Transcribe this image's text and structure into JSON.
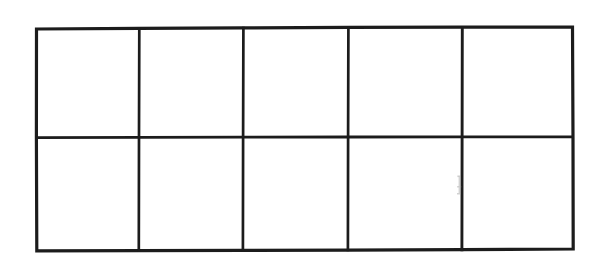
{
  "document": {
    "title": "Blank Grid Table",
    "description": "Hand-drawn blank grid of 5 columns by 2 rows on white paper",
    "background_color": "#ffffff",
    "line_color": "#1c1c1c",
    "artifact_color": "#b8b8b8"
  },
  "grid": {
    "columns": 5,
    "rows": 2,
    "cell_count": 10,
    "outer_border": {
      "left": 36,
      "top": 28,
      "right": 573,
      "bottom": 250,
      "width": 537,
      "height": 222,
      "stroke_width": 3.2
    },
    "vertical_dividers": [
      139,
      243,
      348,
      462
    ],
    "horizontal_dividers": [
      137
    ],
    "divider_stroke_width": 2.6,
    "cells": [
      {
        "id": "r1c1",
        "row": 1,
        "column": 1,
        "label": "",
        "x": 36,
        "y": 28,
        "w": 103,
        "h": 109
      },
      {
        "id": "r1c2",
        "row": 1,
        "column": 2,
        "label": "",
        "x": 139,
        "y": 28,
        "w": 104,
        "h": 109
      },
      {
        "id": "r1c3",
        "row": 1,
        "column": 3,
        "label": "",
        "x": 243,
        "y": 28,
        "w": 105,
        "h": 109
      },
      {
        "id": "r1c4",
        "row": 1,
        "column": 4,
        "label": "",
        "x": 348,
        "y": 28,
        "w": 114,
        "h": 109
      },
      {
        "id": "r1c5",
        "row": 1,
        "column": 5,
        "label": "",
        "x": 462,
        "y": 28,
        "w": 111,
        "h": 109
      },
      {
        "id": "r2c1",
        "row": 2,
        "column": 1,
        "label": "",
        "x": 36,
        "y": 137,
        "w": 103,
        "h": 113
      },
      {
        "id": "r2c2",
        "row": 2,
        "column": 2,
        "label": "",
        "x": 139,
        "y": 137,
        "w": 104,
        "h": 113
      },
      {
        "id": "r2c3",
        "row": 2,
        "column": 3,
        "label": "",
        "x": 243,
        "y": 137,
        "w": 105,
        "h": 113
      },
      {
        "id": "r2c4",
        "row": 2,
        "column": 4,
        "label": "",
        "x": 348,
        "y": 137,
        "w": 114,
        "h": 113
      },
      {
        "id": "r2c5",
        "row": 2,
        "column": 5,
        "label": "",
        "x": 462,
        "y": 137,
        "w": 111,
        "h": 113
      }
    ]
  },
  "artifacts": [
    {
      "id": "smudge-1",
      "description": "faint gray scan smudge beside fourth vertical divider",
      "x": 457,
      "y": 175,
      "w": 5,
      "h": 20
    }
  ]
}
